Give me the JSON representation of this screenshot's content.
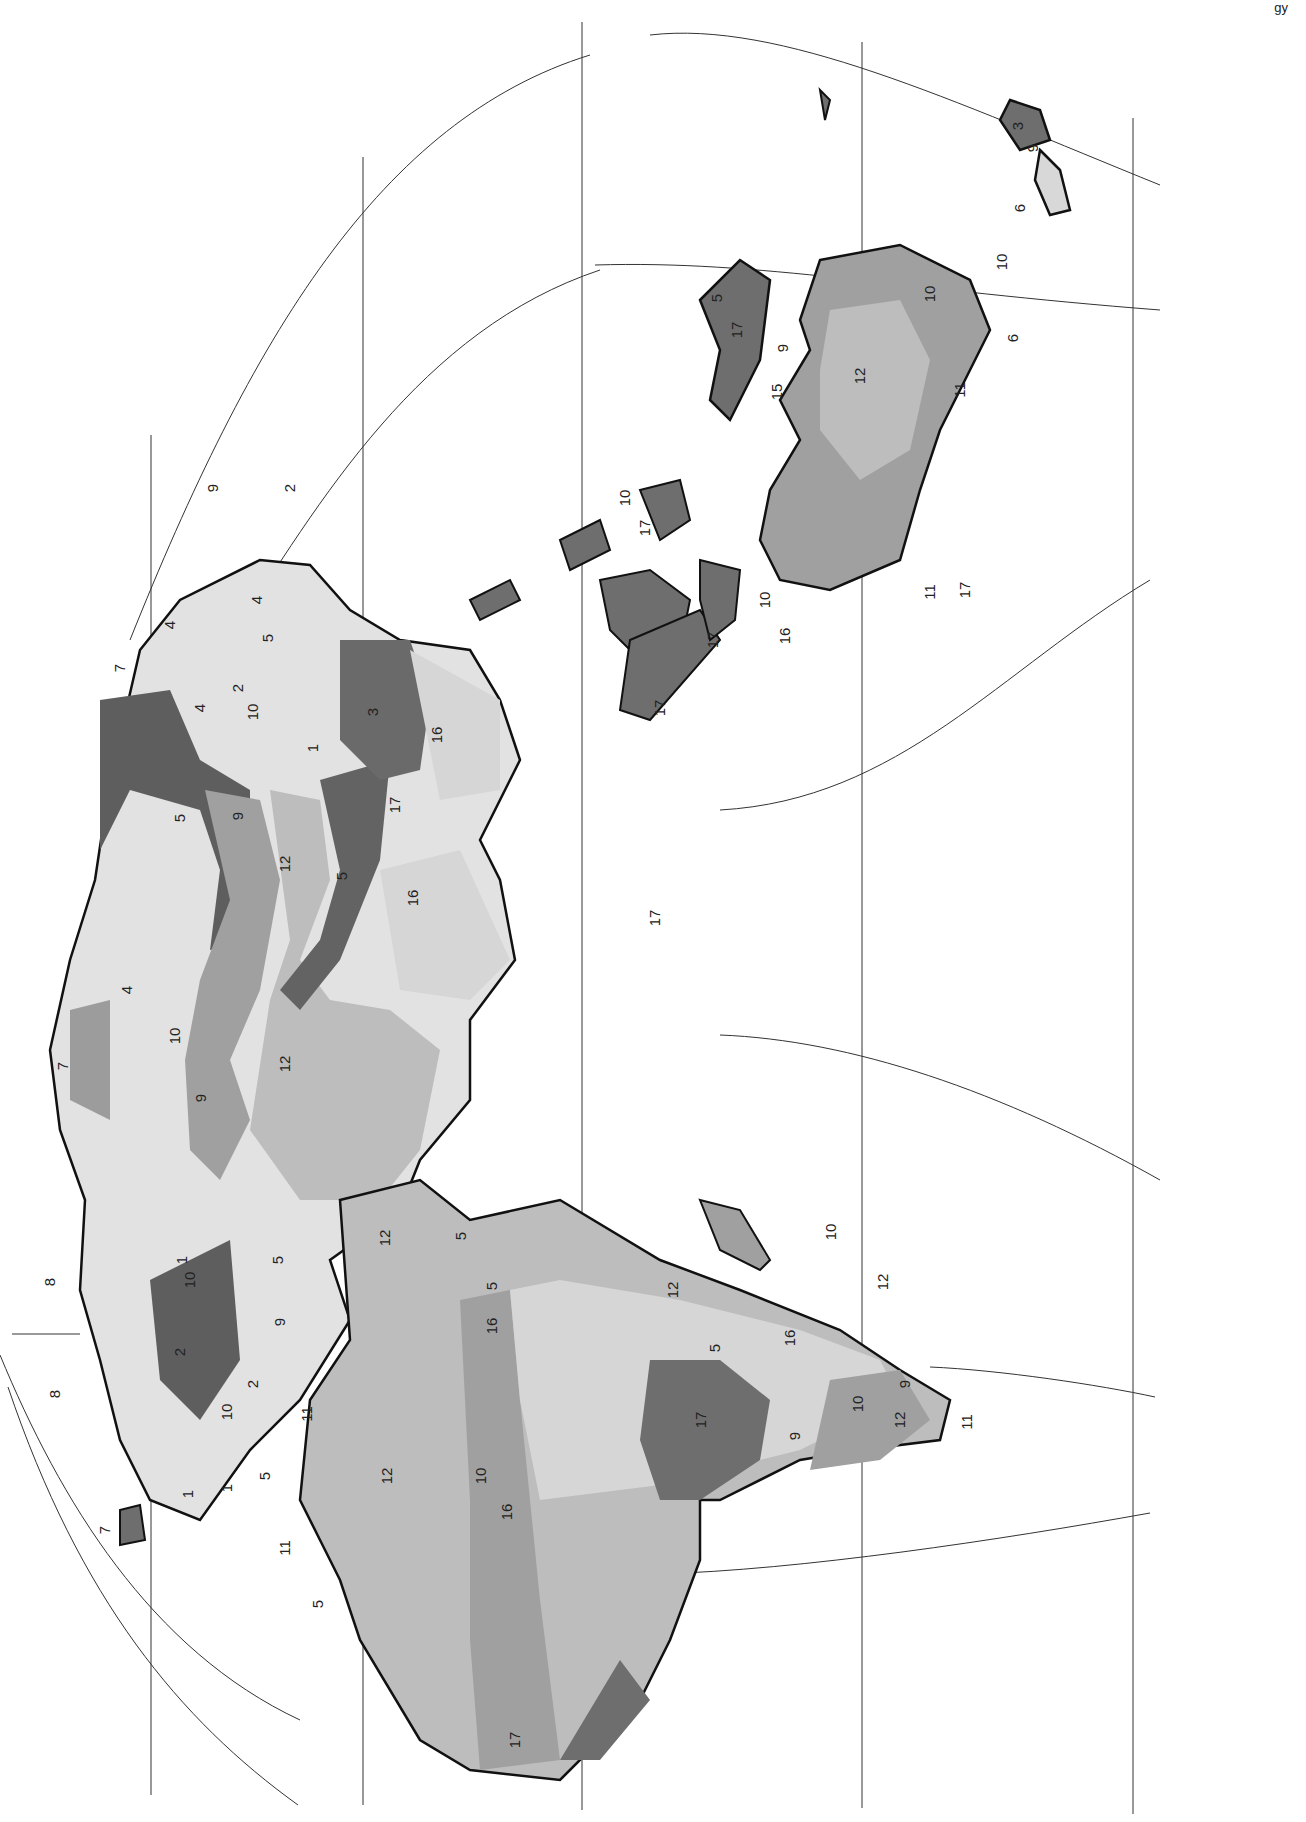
{
  "figure": {
    "type": "thematic-map",
    "orientation": "rotated-90-clockwise",
    "corner_text": "gy",
    "style": {
      "background": "#ffffff",
      "land_outline": "#1a1a1a",
      "graticule": "#333333"
    }
  },
  "zone_shades": {
    "1": "#9a9a9a",
    "2": "#5e5e5e",
    "3": "#6a6a6a",
    "4": "#e2e2e2",
    "5": "#636363",
    "6": "#d8d8d8",
    "7": "#9c9c9c",
    "8": "#a8a8a8",
    "9": "#a2a2a2",
    "10": "#a0a0a0",
    "11": "#7a7a7a",
    "12": "#bdbdbd",
    "15": "#a8a8a8",
    "16": "#d6d6d6",
    "17": "#6e6e6e"
  },
  "labels": [
    {
      "id": "l1",
      "text": "9",
      "x": 218,
      "y": 488
    },
    {
      "id": "l2",
      "text": "2",
      "x": 295,
      "y": 488
    },
    {
      "id": "l3",
      "text": "4",
      "x": 262,
      "y": 600
    },
    {
      "id": "l4",
      "text": "5",
      "x": 273,
      "y": 638
    },
    {
      "id": "l5",
      "text": "7",
      "x": 125,
      "y": 668
    },
    {
      "id": "l6",
      "text": "4",
      "x": 175,
      "y": 625
    },
    {
      "id": "l7",
      "text": "2",
      "x": 243,
      "y": 688
    },
    {
      "id": "l8",
      "text": "4",
      "x": 205,
      "y": 708
    },
    {
      "id": "l9",
      "text": "10",
      "x": 258,
      "y": 712
    },
    {
      "id": "l10",
      "text": "3",
      "x": 378,
      "y": 712
    },
    {
      "id": "l11",
      "text": "16",
      "x": 442,
      "y": 735
    },
    {
      "id": "l12",
      "text": "1",
      "x": 318,
      "y": 748
    },
    {
      "id": "l13",
      "text": "9",
      "x": 243,
      "y": 816
    },
    {
      "id": "l14",
      "text": "5",
      "x": 185,
      "y": 818
    },
    {
      "id": "l15",
      "text": "17",
      "x": 400,
      "y": 805
    },
    {
      "id": "l16",
      "text": "12",
      "x": 290,
      "y": 864
    },
    {
      "id": "l17",
      "text": "5",
      "x": 347,
      "y": 876
    },
    {
      "id": "l18",
      "text": "16",
      "x": 418,
      "y": 898
    },
    {
      "id": "l19",
      "text": "4",
      "x": 132,
      "y": 990
    },
    {
      "id": "l20",
      "text": "10",
      "x": 180,
      "y": 1036
    },
    {
      "id": "l21",
      "text": "12",
      "x": 290,
      "y": 1064
    },
    {
      "id": "l22",
      "text": "7",
      "x": 68,
      "y": 1066
    },
    {
      "id": "l23",
      "text": "9",
      "x": 206,
      "y": 1098
    },
    {
      "id": "l24",
      "text": "1",
      "x": 187,
      "y": 1260
    },
    {
      "id": "l25",
      "text": "10",
      "x": 195,
      "y": 1280
    },
    {
      "id": "l26",
      "text": "5",
      "x": 283,
      "y": 1260
    },
    {
      "id": "l27",
      "text": "9",
      "x": 285,
      "y": 1322
    },
    {
      "id": "l28",
      "text": "2",
      "x": 185,
      "y": 1352
    },
    {
      "id": "l29",
      "text": "2",
      "x": 258,
      "y": 1384
    },
    {
      "id": "l30",
      "text": "10",
      "x": 232,
      "y": 1412
    },
    {
      "id": "l31",
      "text": "11",
      "x": 312,
      "y": 1414
    },
    {
      "id": "l32",
      "text": "8",
      "x": 55,
      "y": 1282
    },
    {
      "id": "l33",
      "text": "8",
      "x": 60,
      "y": 1394
    },
    {
      "id": "l34",
      "text": "1",
      "x": 193,
      "y": 1494
    },
    {
      "id": "l35",
      "text": "1",
      "x": 232,
      "y": 1488
    },
    {
      "id": "l36",
      "text": "5",
      "x": 270,
      "y": 1476
    },
    {
      "id": "l37",
      "text": "7",
      "x": 110,
      "y": 1530
    },
    {
      "id": "l38",
      "text": "11",
      "x": 290,
      "y": 1548
    },
    {
      "id": "l39",
      "text": "5",
      "x": 323,
      "y": 1604
    },
    {
      "id": "l40",
      "text": "12",
      "x": 390,
      "y": 1238
    },
    {
      "id": "l41",
      "text": "5",
      "x": 466,
      "y": 1236
    },
    {
      "id": "l42",
      "text": "5",
      "x": 497,
      "y": 1286
    },
    {
      "id": "l43",
      "text": "16",
      "x": 497,
      "y": 1326
    },
    {
      "id": "l44",
      "text": "12",
      "x": 392,
      "y": 1476
    },
    {
      "id": "l45",
      "text": "10",
      "x": 486,
      "y": 1476
    },
    {
      "id": "l46",
      "text": "16",
      "x": 512,
      "y": 1512
    },
    {
      "id": "l47",
      "text": "12",
      "x": 678,
      "y": 1290
    },
    {
      "id": "l48",
      "text": "5",
      "x": 720,
      "y": 1348
    },
    {
      "id": "l49",
      "text": "16",
      "x": 795,
      "y": 1338
    },
    {
      "id": "l50",
      "text": "17",
      "x": 706,
      "y": 1420
    },
    {
      "id": "l51",
      "text": "9",
      "x": 800,
      "y": 1436
    },
    {
      "id": "l52",
      "text": "10",
      "x": 863,
      "y": 1404
    },
    {
      "id": "l53",
      "text": "9",
      "x": 910,
      "y": 1384
    },
    {
      "id": "l54",
      "text": "12",
      "x": 905,
      "y": 1420
    },
    {
      "id": "l55",
      "text": "11",
      "x": 972,
      "y": 1422
    },
    {
      "id": "l56",
      "text": "10",
      "x": 836,
      "y": 1232
    },
    {
      "id": "l57",
      "text": "12",
      "x": 888,
      "y": 1282
    },
    {
      "id": "l58",
      "text": "17",
      "x": 520,
      "y": 1740
    },
    {
      "id": "l59",
      "text": "17",
      "x": 660,
      "y": 918
    },
    {
      "id": "l60",
      "text": "17",
      "x": 665,
      "y": 708
    },
    {
      "id": "l61",
      "text": "16",
      "x": 790,
      "y": 636
    },
    {
      "id": "l62",
      "text": "17",
      "x": 718,
      "y": 640
    },
    {
      "id": "l63",
      "text": "10",
      "x": 770,
      "y": 600
    },
    {
      "id": "l64",
      "text": "10",
      "x": 630,
      "y": 498
    },
    {
      "id": "l65",
      "text": "17",
      "x": 650,
      "y": 528
    },
    {
      "id": "l66",
      "text": "5",
      "x": 722,
      "y": 298
    },
    {
      "id": "l67",
      "text": "17",
      "x": 742,
      "y": 330
    },
    {
      "id": "l68",
      "text": "9",
      "x": 788,
      "y": 348
    },
    {
      "id": "l69",
      "text": "15",
      "x": 782,
      "y": 392
    },
    {
      "id": "l70",
      "text": "12",
      "x": 865,
      "y": 376
    },
    {
      "id": "l71",
      "text": "10",
      "x": 935,
      "y": 294
    },
    {
      "id": "l72",
      "text": "11",
      "x": 965,
      "y": 390
    },
    {
      "id": "l73",
      "text": "11",
      "x": 935,
      "y": 592
    },
    {
      "id": "l74",
      "text": "17",
      "x": 970,
      "y": 590
    },
    {
      "id": "l75",
      "text": "10",
      "x": 1007,
      "y": 262
    },
    {
      "id": "l76",
      "text": "6",
      "x": 1018,
      "y": 338
    },
    {
      "id": "l77",
      "text": "3",
      "x": 1023,
      "y": 126
    },
    {
      "id": "l78",
      "text": "9",
      "x": 1038,
      "y": 148
    },
    {
      "id": "l79",
      "text": "6",
      "x": 1025,
      "y": 208
    }
  ]
}
